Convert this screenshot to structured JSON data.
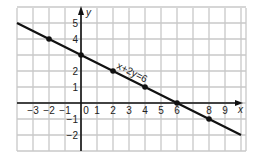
{
  "chart_data": {
    "type": "line",
    "title": "",
    "equation_label": "x+2y=6",
    "xlabel": "x",
    "ylabel": "y",
    "xlim": [
      -4,
      10
    ],
    "ylim": [
      -3,
      6
    ],
    "grid": true,
    "x_tick_labels": [
      "-3",
      "-2",
      "-1",
      "0",
      "1",
      "2",
      "3",
      "4",
      "5",
      "6",
      "8",
      "9"
    ],
    "x_tick_values": [
      -3,
      -2,
      -1,
      0,
      1,
      2,
      3,
      4,
      5,
      6,
      8,
      9
    ],
    "y_tick_labels": [
      "5",
      "4",
      "2",
      "1",
      "-1",
      "-2"
    ],
    "y_tick_values": [
      5,
      4,
      2,
      1,
      -1,
      -2
    ],
    "series": [
      {
        "name": "x+2y=6",
        "line_endpoints": [
          [
            -4,
            5
          ],
          [
            10,
            -2
          ]
        ],
        "marked_points": [
          [
            -2,
            4
          ],
          [
            0,
            3
          ],
          [
            2,
            2
          ],
          [
            4,
            1
          ],
          [
            6,
            0
          ],
          [
            8,
            -1
          ]
        ]
      }
    ],
    "colors": {
      "grid": "#c8c8c8",
      "axis": "#111111",
      "line": "#111111"
    }
  }
}
